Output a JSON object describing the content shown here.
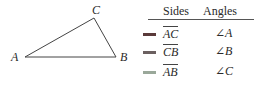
{
  "triangle": {
    "vertices": {
      "A": {
        "label": "A"
      },
      "B": {
        "label": "B"
      },
      "C": {
        "label": "C"
      }
    }
  },
  "table": {
    "headers": {
      "sides": "Sides",
      "angles": "Angles"
    },
    "rows": [
      {
        "side": "AC",
        "angle": "∠A",
        "marker_color": "#5a3a3a"
      },
      {
        "side": "CB",
        "angle": "∠B",
        "marker_color": "#6b6060"
      },
      {
        "side": "AB",
        "angle": "∠C",
        "marker_color": "#9aa89a"
      }
    ]
  }
}
